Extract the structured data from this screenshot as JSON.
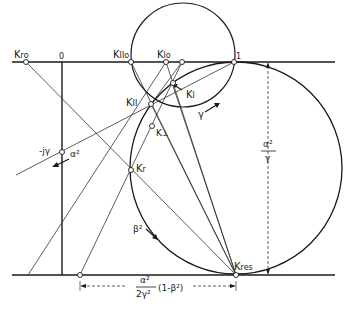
{
  "diagram": {
    "labels": {
      "k_ro": "K",
      "k_ro_sub": "ro",
      "origin": "0",
      "k_iio": "K",
      "k_iio_sub": "IIo",
      "k_lo": "K",
      "k_lo_sub": "lo",
      "one": "1",
      "k_ii": "K",
      "k_ii_sub": "II",
      "k_l": "K",
      "k_l_sub": "l",
      "k_perp": "K",
      "k_perp_sub": "⊥",
      "neg_j_gamma": "-jγ",
      "alpha_sq": "α²",
      "gamma_arrow": "γ",
      "k_r": "K",
      "k_r_sub": "r",
      "beta_sq": "β²",
      "k_res": "K",
      "k_res_sub": "res",
      "right_dim_num": "α²",
      "right_dim_den": "γ",
      "bottom_dim_num": "α²",
      "bottom_dim_den": "2γ²",
      "bottom_dim_tail": "(1-β²)"
    },
    "colors": {
      "ink": "#1a1a1a",
      "background": "#ffffff"
    }
  }
}
